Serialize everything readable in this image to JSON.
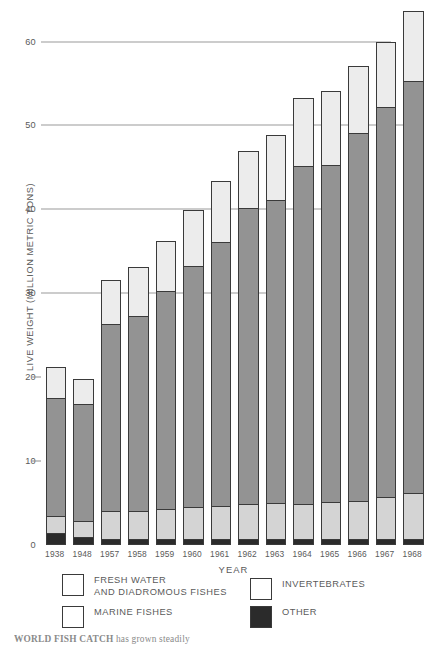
{
  "chart_data": {
    "type": "bar",
    "stacked": true,
    "title": "WORLD FISH CATCH",
    "xlabel": "YEAR",
    "ylabel": "LIVE WEIGHT (MILLION METRIC TONS)",
    "ylim": [
      0,
      64
    ],
    "yticks": [
      0,
      10,
      20,
      30,
      40,
      50,
      60
    ],
    "ytick_labels": [
      "0",
      "10",
      "20",
      "30",
      "40",
      "50",
      "60"
    ],
    "gridlines": [
      30,
      40,
      50,
      60
    ],
    "grid": true,
    "legend_position": "below-axes",
    "categories": [
      "1938",
      "1948",
      "1957",
      "1958",
      "1959",
      "1960",
      "1961",
      "1962",
      "1963",
      "1964",
      "1965",
      "1966",
      "1967",
      "1968"
    ],
    "series": [
      {
        "name": "OTHER",
        "color": "#2b2b2b",
        "values": [
          1.4,
          1.0,
          0.7,
          0.7,
          0.7,
          0.7,
          0.7,
          0.7,
          0.7,
          0.7,
          0.7,
          0.7,
          0.7,
          0.7
        ]
      },
      {
        "name": "FRESH WATER AND DIADROMOUS FISHES",
        "color": "#d4d4d4",
        "values": [
          2.1,
          1.9,
          3.4,
          3.4,
          3.6,
          3.8,
          4.0,
          4.2,
          4.3,
          4.2,
          4.4,
          4.5,
          5.0,
          5.5
        ]
      },
      {
        "name": "MARINE FISHES",
        "color": "#939393",
        "values": [
          14.0,
          13.9,
          22.2,
          23.2,
          26.0,
          28.8,
          31.4,
          35.3,
          36.1,
          40.3,
          40.2,
          43.9,
          46.5,
          49.1
        ]
      },
      {
        "name": "INVERTEBRATES",
        "color": "#ececec",
        "values": [
          3.7,
          3.0,
          5.3,
          5.8,
          5.9,
          6.6,
          7.3,
          6.8,
          7.8,
          8.1,
          8.8,
          8.0,
          7.8,
          8.3
        ]
      }
    ],
    "totals": [
      21.2,
      19.8,
      31.6,
      33.1,
      36.2,
      39.9,
      43.4,
      47.0,
      48.9,
      53.3,
      54.1,
      57.1,
      60.0,
      63.6
    ]
  },
  "legend": {
    "entries": [
      {
        "label_line1": "FRESH WATER",
        "label_line2": "AND DIADROMOUS FISHES",
        "swatch": "fresh"
      },
      {
        "label_line1": "INVERTEBRATES",
        "label_line2": "",
        "swatch": "invert"
      },
      {
        "label_line1": "MARINE FISHES",
        "label_line2": "",
        "swatch": "marine"
      },
      {
        "label_line1": "OTHER",
        "label_line2": "",
        "swatch": "other"
      }
    ]
  },
  "caption": {
    "bold_lead": "WORLD FISH CATCH",
    "rest": " has grown steadily"
  }
}
